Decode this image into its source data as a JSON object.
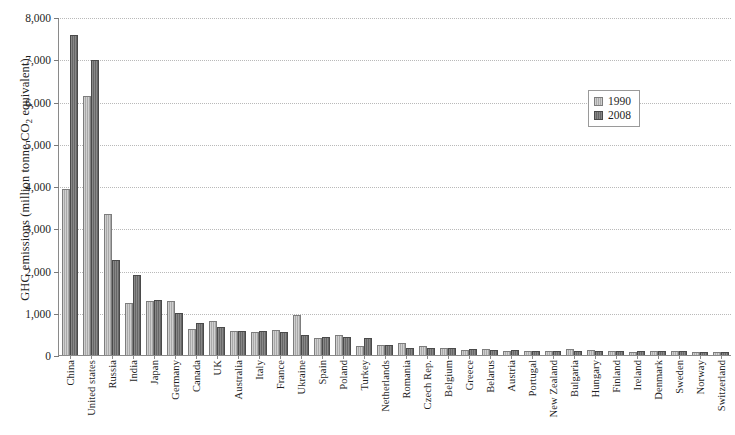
{
  "chart_data": {
    "type": "bar",
    "title": "",
    "xlabel": "",
    "ylabel": "GHG emissions (million tonne CO2 equivalent)",
    "ylabel_parts": {
      "pre": "GHG emissions (million tonne CO",
      "sub": "2",
      "post": " equivalent)"
    },
    "ylim": [
      0,
      8000
    ],
    "ytick_labels": [
      "8,000",
      "7,000",
      "6,000",
      "5,000",
      "4,000",
      "3,000",
      "2,000",
      "1,000",
      "0"
    ],
    "ytick_values": [
      8000,
      7000,
      6000,
      5000,
      4000,
      3000,
      2000,
      1000,
      0
    ],
    "grid": true,
    "grid_style": "dotted-horizontal",
    "legend_position": "upper-right-inside",
    "categories": [
      "China",
      "United states",
      "Russia",
      "India",
      "Japan",
      "Germany",
      "Canada",
      "UK",
      "Australia",
      "Italy",
      "France",
      "Ukraine",
      "Spain",
      "Poland",
      "Turkey",
      "Netherlands",
      "Romania",
      "Czech Rep.",
      "Belgium",
      "Greece",
      "Belarus",
      "Austria",
      "Portugal",
      "New Zealand",
      "Bulgaria",
      "Hungary",
      "Finland",
      "Ireland",
      "Denmark",
      "Sweden",
      "Norway",
      "Switzerland"
    ],
    "series": [
      {
        "name": "1990",
        "color": "#a9a9a9",
        "values": [
          3900,
          6100,
          3320,
          1200,
          1260,
          1250,
          600,
          790,
          550,
          520,
          560,
          930,
          380,
          460,
          190,
          210,
          250,
          190,
          145,
          105,
          130,
          80,
          60,
          62,
          120,
          98,
          72,
          56,
          70,
          72,
          50,
          53
        ]
      },
      {
        "name": "2008",
        "color": "#676767",
        "values": [
          7550,
          6950,
          2230,
          1880,
          1280,
          960,
          730,
          630,
          550,
          555,
          530,
          440,
          410,
          400,
          370,
          205,
          146,
          142,
          134,
          127,
          90,
          87,
          78,
          75,
          73,
          73,
          70,
          68,
          64,
          64,
          54,
          53
        ]
      }
    ]
  },
  "legend": {
    "items": [
      {
        "label": "1990",
        "key": "s1990"
      },
      {
        "label": "2008",
        "key": "s2008"
      }
    ]
  }
}
